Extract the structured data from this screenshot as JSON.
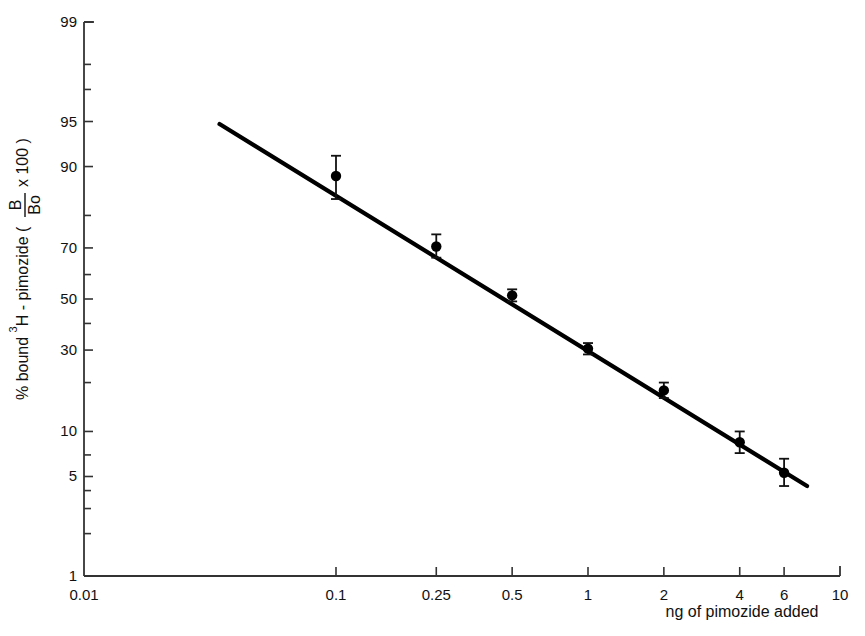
{
  "chart_data": {
    "type": "scatter",
    "title": "",
    "xlabel": "ng of pimozide added",
    "ylabel": "% bound 3H-pimozide ( B/Bo x 100 )",
    "ylabel_parts": {
      "prefix": "% bound ",
      "superscript": "3",
      "middle": "H - pimozide ( ",
      "numerator": "B",
      "denominator": "Bo",
      "multiplier": "x 100",
      "suffix": " )"
    },
    "x_scale": "log",
    "y_scale": "logit",
    "xlim": [
      0.01,
      10
    ],
    "ylim": [
      1,
      99
    ],
    "grid": false,
    "legend": "none",
    "x_ticks": [
      {
        "value": 0.01,
        "label": "0.01"
      },
      {
        "value": 0.1,
        "label": "0.1"
      },
      {
        "value": 0.25,
        "label": "0.25"
      },
      {
        "value": 0.5,
        "label": "0.5"
      },
      {
        "value": 1,
        "label": "1"
      },
      {
        "value": 2,
        "label": "2"
      },
      {
        "value": 4,
        "label": "4"
      },
      {
        "value": 6,
        "label": "6"
      },
      {
        "value": 10,
        "label": "10"
      }
    ],
    "y_ticks": [
      {
        "value": 99,
        "label": "99"
      },
      {
        "value": 98,
        "label": ""
      },
      {
        "value": 97,
        "label": ""
      },
      {
        "value": 95,
        "label": "95"
      },
      {
        "value": 90,
        "label": "90"
      },
      {
        "value": 80,
        "label": ""
      },
      {
        "value": 70,
        "label": "70"
      },
      {
        "value": 60,
        "label": ""
      },
      {
        "value": 50,
        "label": "50"
      },
      {
        "value": 40,
        "label": ""
      },
      {
        "value": 30,
        "label": "30"
      },
      {
        "value": 20,
        "label": ""
      },
      {
        "value": 10,
        "label": "10"
      },
      {
        "value": 7,
        "label": ""
      },
      {
        "value": 5,
        "label": "5"
      },
      {
        "value": 4,
        "label": ""
      },
      {
        "value": 3,
        "label": ""
      },
      {
        "value": 2,
        "label": ""
      },
      {
        "value": 1,
        "label": "1"
      }
    ],
    "series": [
      {
        "name": "3H-pimozide standard curve",
        "marker": "filled-circle",
        "x": [
          0.1,
          0.25,
          0.5,
          1,
          2,
          4,
          6
        ],
        "values": [
          88.5,
          70.5,
          51.5,
          30.5,
          18.0,
          8.5,
          5.3
        ],
        "y_err_upper": [
          91.5,
          74.5,
          54.0,
          32.5,
          20.0,
          10.0,
          6.6
        ],
        "y_err_lower": [
          84.0,
          66.5,
          49.0,
          28.5,
          16.2,
          7.2,
          4.3
        ]
      }
    ],
    "fit_line": {
      "x_start": 0.0345,
      "y_start": 94.8,
      "x_end": 7.4,
      "y_end": 4.3,
      "style": "solid"
    }
  },
  "figure": {
    "background": "#ffffff",
    "ink_color": "#111111"
  }
}
